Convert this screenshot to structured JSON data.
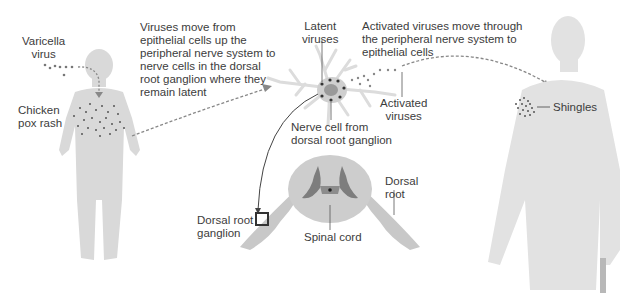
{
  "diagram": {
    "colors": {
      "figure_fill": "#d6d6d6",
      "figure_light": "#e6e6e6",
      "spinal_cord": "#c9c9c9",
      "gray_matter": "#7d7d7d",
      "dots": "#555555",
      "text": "#3c3c3c",
      "arrow": "#8a8a8a"
    },
    "labels": {
      "varicella_virus": "Varicella\nvirus",
      "chicken_pox_rash": "Chicken\npox rash",
      "step1_text": "Viruses move from\nepithelial cells up the\nperipheral nerve system to\nnerve cells in the dorsal\nroot ganglion where they\nremain latent",
      "latent_viruses": "Latent\nviruses",
      "step2_text": "Activated viruses move through\nthe peripheral nerve system to\nepithelial cells",
      "activated_viruses": "Activated\nviruses",
      "nerve_cell": "Nerve cell from\ndorsal root ganglion",
      "dorsal_root": "Dorsal\nroot",
      "dorsal_root_ganglion": "Dorsal root\nganglion",
      "spinal_cord": "Spinal cord",
      "shingles": "Shingles"
    },
    "nodes": [
      {
        "id": "child",
        "label": "Child with chicken pox rash"
      },
      {
        "id": "neuron",
        "label": "Nerve cell from dorsal root ganglion"
      },
      {
        "id": "spinal_cord",
        "label": "Spinal cord cross-section"
      },
      {
        "id": "adult",
        "label": "Older adult with shingles"
      }
    ],
    "edges": [
      {
        "from": "child",
        "to": "neuron",
        "style": "dashed",
        "label": "Viruses move up peripheral nerve to ganglion"
      },
      {
        "from": "neuron",
        "to": "adult",
        "style": "dashed",
        "label": "Activated viruses move to epithelial cells"
      },
      {
        "from": "neuron",
        "to": "spinal_cord",
        "style": "solid",
        "label": "Location: dorsal root ganglion"
      }
    ]
  }
}
